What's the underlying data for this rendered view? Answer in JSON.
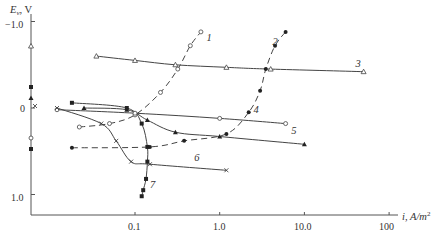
{
  "chart_data": {
    "type": "line",
    "title": "",
    "xlabel": "i, A/m²",
    "ylabel": "E_v, V",
    "xscale": "log",
    "xlim": [
      0.01,
      120
    ],
    "ylim": [
      -1.0,
      1.2
    ],
    "y_inverted_note": "negative potentials plotted upward",
    "grid": false,
    "x_ticks": [
      "0.1",
      "1.0",
      "10.0",
      "100"
    ],
    "y_ticks": [
      "-1.0",
      "0",
      "1.0"
    ],
    "series": [
      {
        "name": "1",
        "style": "dashed",
        "marker": "open-circle",
        "points": [
          [
            0.022,
            0.22
          ],
          [
            0.05,
            0.18
          ],
          [
            0.1,
            0.08
          ],
          [
            0.2,
            -0.18
          ],
          [
            0.32,
            -0.45
          ],
          [
            0.45,
            -0.72
          ],
          [
            0.6,
            -0.88
          ]
        ]
      },
      {
        "name": "2",
        "style": "dashed",
        "marker": "filled-circle",
        "points": [
          [
            0.018,
            0.46
          ],
          [
            0.15,
            0.45
          ],
          [
            0.38,
            0.38
          ],
          [
            1.2,
            0.3
          ],
          [
            2.2,
            0.05
          ],
          [
            3.0,
            -0.2
          ],
          [
            3.5,
            -0.45
          ],
          [
            4.5,
            -0.72
          ],
          [
            6.0,
            -0.88
          ]
        ]
      },
      {
        "name": "3",
        "style": "solid",
        "marker": "open-triangle",
        "points": [
          [
            0.035,
            -0.6
          ],
          [
            0.1,
            -0.55
          ],
          [
            0.3,
            -0.5
          ],
          [
            1.2,
            -0.47
          ],
          [
            4.0,
            -0.45
          ],
          [
            50.0,
            -0.42
          ]
        ]
      },
      {
        "name": "4",
        "style": "solid",
        "marker": "open-circle",
        "points": [
          [
            0.012,
            0.02
          ],
          [
            0.1,
            0.06
          ],
          [
            1.0,
            0.12
          ],
          [
            6.0,
            0.18
          ]
        ]
      },
      {
        "name": "5",
        "style": "solid",
        "marker": "filled-triangle",
        "points": [
          [
            0.025,
            0.0
          ],
          [
            0.08,
            0.02
          ],
          [
            0.14,
            0.14
          ],
          [
            0.3,
            0.28
          ],
          [
            1.0,
            0.33
          ],
          [
            10.0,
            0.42
          ]
        ]
      },
      {
        "name": "6",
        "style": "solid",
        "marker": "cross",
        "points": [
          [
            0.012,
            0.0
          ],
          [
            0.04,
            0.18
          ],
          [
            0.06,
            0.38
          ],
          [
            0.09,
            0.62
          ],
          [
            0.15,
            0.65
          ],
          [
            1.2,
            0.72
          ]
        ]
      },
      {
        "name": "7",
        "style": "solid",
        "marker": "filled-square",
        "points": [
          [
            0.018,
            -0.06
          ],
          [
            0.08,
            0.0
          ],
          [
            0.12,
            0.18
          ],
          [
            0.14,
            0.45
          ],
          [
            0.14,
            0.62
          ],
          [
            0.135,
            0.82
          ],
          [
            0.125,
            0.95
          ],
          [
            0.12,
            1.02
          ]
        ]
      }
    ],
    "curve_labels": [
      {
        "text": "1",
        "i": 0.7,
        "E": -0.78
      },
      {
        "text": "2",
        "i": 4.2,
        "E": -0.73
      },
      {
        "text": "3",
        "i": 40.0,
        "E": -0.47
      },
      {
        "text": "4",
        "i": 2.5,
        "E": 0.06
      },
      {
        "text": "5",
        "i": 7.0,
        "E": 0.3
      },
      {
        "text": "6",
        "i": 0.5,
        "E": 0.61
      },
      {
        "text": "7",
        "i": 0.15,
        "E": 0.92
      }
    ]
  },
  "axis": {
    "y_title_main": "E",
    "y_title_sub": "v",
    "y_title_unit": ", V",
    "x_title": "i, A/m",
    "x_title_sup": "2",
    "x_ticks": [
      "0.1",
      "1.0",
      "10.0",
      "100"
    ],
    "y_ticks": [
      "−1.0",
      "0",
      "1.0"
    ]
  }
}
